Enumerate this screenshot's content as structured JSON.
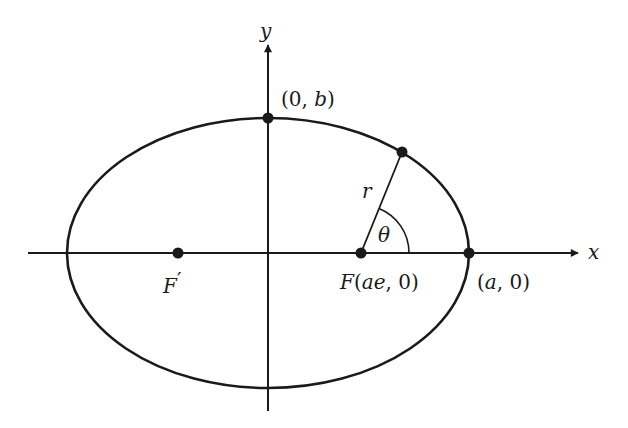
{
  "diagram": {
    "type": "ellipse-polar-geometry",
    "colors": {
      "stroke": "#1a1a1a",
      "background": "#ffffff"
    },
    "axes": {
      "x_label": "x",
      "y_label": "y"
    },
    "ellipse": {
      "center_px": [
        268,
        253
      ],
      "semi_major_px": 201,
      "semi_minor_px": 135
    },
    "points": {
      "top_vertex": {
        "label": "(0, b)",
        "px": [
          268,
          118
        ]
      },
      "right_vertex": {
        "label": "(a, 0)",
        "px": [
          469,
          253
        ]
      },
      "focus": {
        "label": "F(ae, 0)",
        "px": [
          361,
          253
        ]
      },
      "focus_prime": {
        "label": "F′",
        "px": [
          178,
          253
        ]
      },
      "orbit_point": {
        "px": [
          402,
          152
        ]
      }
    },
    "labels": {
      "radius": "r",
      "angle": "θ",
      "top_vertex_open": "(0, ",
      "top_vertex_var": "b",
      "top_vertex_close": ")",
      "right_vertex_open": "(",
      "right_vertex_var": "a",
      "right_vertex_close": ", 0)",
      "focus_name": "F",
      "focus_open": "(",
      "focus_var": "ae",
      "focus_close": ", 0)",
      "focus_prime_name": "F",
      "focus_prime_mark": "′"
    }
  }
}
